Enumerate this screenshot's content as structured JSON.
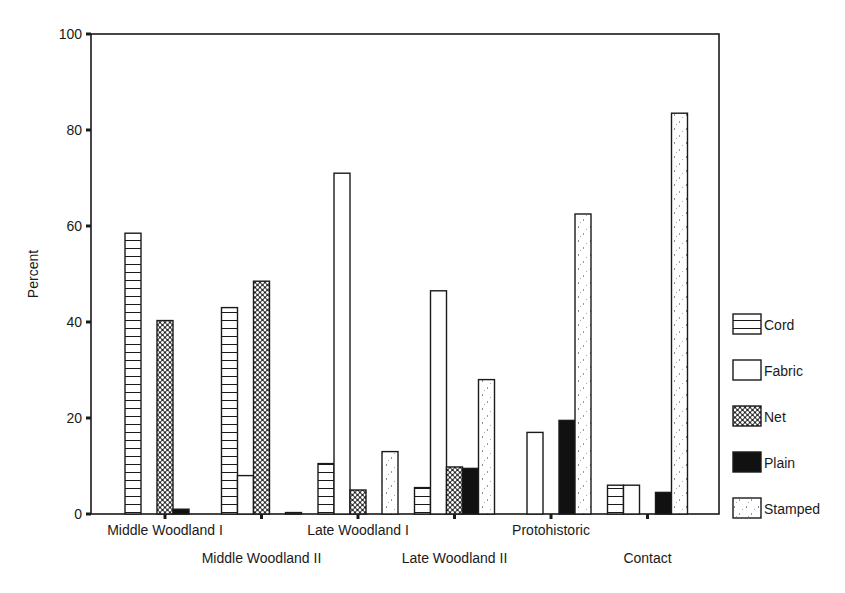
{
  "chart_data": {
    "type": "bar",
    "title": "",
    "xlabel": "",
    "ylabel": "Percent",
    "ylim": [
      0,
      100
    ],
    "yticks": [
      0,
      20,
      40,
      60,
      80,
      100
    ],
    "grid": false,
    "legend_position": "right",
    "categories": [
      "Middle Woodland I",
      "Middle Woodland II",
      "Late Woodland I",
      "Late Woodland II",
      "Protohistoric",
      "Contact"
    ],
    "series": [
      {
        "name": "Cord",
        "pattern": "horizontal-lines",
        "values": [
          58.5,
          43.0,
          10.5,
          5.5,
          0,
          6.0
        ]
      },
      {
        "name": "Fabric",
        "pattern": "empty",
        "values": [
          0,
          8.0,
          71.0,
          46.5,
          17.0,
          6.0
        ]
      },
      {
        "name": "Net",
        "pattern": "crosshatch",
        "values": [
          40.3,
          48.5,
          5.0,
          9.8,
          0,
          0
        ]
      },
      {
        "name": "Plain",
        "pattern": "solid-black",
        "values": [
          1.0,
          0,
          0,
          9.5,
          19.5,
          4.5
        ]
      },
      {
        "name": "Stamped",
        "pattern": "sparse-dots",
        "values": [
          0,
          0.3,
          13.0,
          28.0,
          62.5,
          83.5
        ]
      }
    ]
  },
  "axis": {
    "y_title": "Percent",
    "y_tick_labels": [
      "0",
      "20",
      "40",
      "60",
      "80",
      "100"
    ]
  },
  "legend": {
    "items": [
      "Cord",
      "Fabric",
      "Net",
      "Plain",
      "Stamped"
    ]
  },
  "colors": {
    "ink": "#1a1a1a",
    "background": "#ffffff"
  }
}
